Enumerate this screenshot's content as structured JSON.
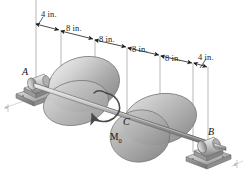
{
  "figure": {
    "type": "mechanics-free-body-diagram",
    "background_color": "#ffffff",
    "ink_color": "#1a1a1a",
    "metal_light": "#e8e8e8",
    "metal_mid": "#b4b4b4",
    "metal_dark": "#7a7a7a"
  },
  "dimensions": {
    "units": "in.",
    "chain": [
      {
        "id": "d1",
        "label": "4 in.",
        "value": 4
      },
      {
        "id": "d2",
        "label": "8 in.",
        "value": 8
      },
      {
        "id": "d3",
        "label": "8 in.",
        "value": 8
      },
      {
        "id": "d4",
        "label": "8 in.",
        "value": 8
      },
      {
        "id": "d5",
        "label": "8 in.",
        "value": 8
      },
      {
        "id": "d6",
        "label": "4 in.",
        "value": 4
      }
    ],
    "total": 40
  },
  "points": {
    "a": "A",
    "b": "B",
    "c": "C"
  },
  "loads": {
    "moment_symbol": "M",
    "moment_subscript": "0"
  },
  "axes": {
    "x": "x",
    "z": "z"
  }
}
